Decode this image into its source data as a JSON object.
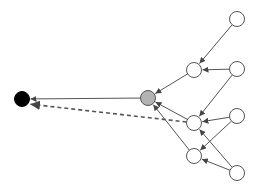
{
  "diagram": {
    "type": "directed-graph",
    "colors": {
      "edge": "#555555",
      "node_stroke": "#555555",
      "node_default_fill": "#ffffff",
      "node_gray_fill": "#b3b3b3",
      "node_black_fill": "#000000"
    },
    "nodes": [
      {
        "id": "target",
        "kind": "black"
      },
      {
        "id": "hub",
        "kind": "gray"
      },
      {
        "id": "mid1",
        "kind": "white"
      },
      {
        "id": "mid2",
        "kind": "white"
      },
      {
        "id": "mid3",
        "kind": "white"
      },
      {
        "id": "src1",
        "kind": "white"
      },
      {
        "id": "src2",
        "kind": "white"
      },
      {
        "id": "src3",
        "kind": "white"
      },
      {
        "id": "src4",
        "kind": "white"
      }
    ],
    "edges": [
      {
        "from": "src1",
        "to": "mid1",
        "style": "solid"
      },
      {
        "from": "src2",
        "to": "mid1",
        "style": "solid"
      },
      {
        "from": "src2",
        "to": "mid2",
        "style": "solid"
      },
      {
        "from": "src3",
        "to": "mid2",
        "style": "solid"
      },
      {
        "from": "src3",
        "to": "mid3",
        "style": "solid"
      },
      {
        "from": "src4",
        "to": "mid2",
        "style": "solid"
      },
      {
        "from": "src4",
        "to": "mid3",
        "style": "solid"
      },
      {
        "from": "mid1",
        "to": "hub",
        "style": "solid"
      },
      {
        "from": "mid2",
        "to": "hub",
        "style": "solid"
      },
      {
        "from": "mid3",
        "to": "hub",
        "style": "solid"
      },
      {
        "from": "hub",
        "to": "target",
        "style": "solid"
      },
      {
        "from": "mid2",
        "to": "target",
        "style": "dashed"
      }
    ]
  }
}
